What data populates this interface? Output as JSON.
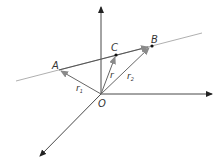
{
  "diagram": {
    "points": {
      "O": {
        "label": "O"
      },
      "A": {
        "label": "A"
      },
      "B": {
        "label": "B"
      },
      "C": {
        "label": "C"
      }
    },
    "vectors": {
      "r1": {
        "label": "r",
        "subscript": "1",
        "from": "O",
        "to": "A"
      },
      "r": {
        "label": "r",
        "subscript": "",
        "from": "O",
        "to": "C"
      },
      "r2": {
        "label": "r",
        "subscript": "2",
        "from": "O",
        "to": "B"
      },
      "AB": {
        "from": "A",
        "to": "B"
      }
    },
    "axes": [
      "vertical-axis",
      "horizontal-axis",
      "depth-axis"
    ],
    "colors": {
      "axis": "#333333",
      "line": "#9a9a9a",
      "vector": "#666666",
      "vector_head": "#8a8a8a",
      "point": "#111111"
    }
  }
}
